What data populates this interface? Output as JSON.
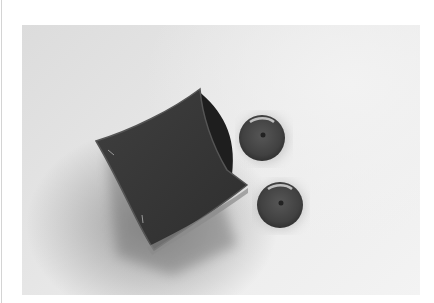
{
  "image": {
    "description": "Photograph of a small square fabric/felt pouch with two round buttons beside it on a light gray background, in grayscale tones",
    "alt": "Fabric pouch with two buttons"
  },
  "subjects": [
    {
      "name": "fabric-pouch",
      "shape": "square open pouch",
      "tone": "dark gray"
    },
    {
      "name": "button-top",
      "shape": "round, single center hole",
      "tone": "dark gray"
    },
    {
      "name": "button-bottom",
      "shape": "round, single center hole",
      "tone": "dark gray"
    }
  ],
  "colors": {
    "page_background": "#ffffff",
    "photo_background": "#e6e6e6",
    "pouch": "#3a3a3a",
    "pouch_inner": "#1e1e1e",
    "button": "#474747",
    "left_rule": "#d4d4d4"
  }
}
